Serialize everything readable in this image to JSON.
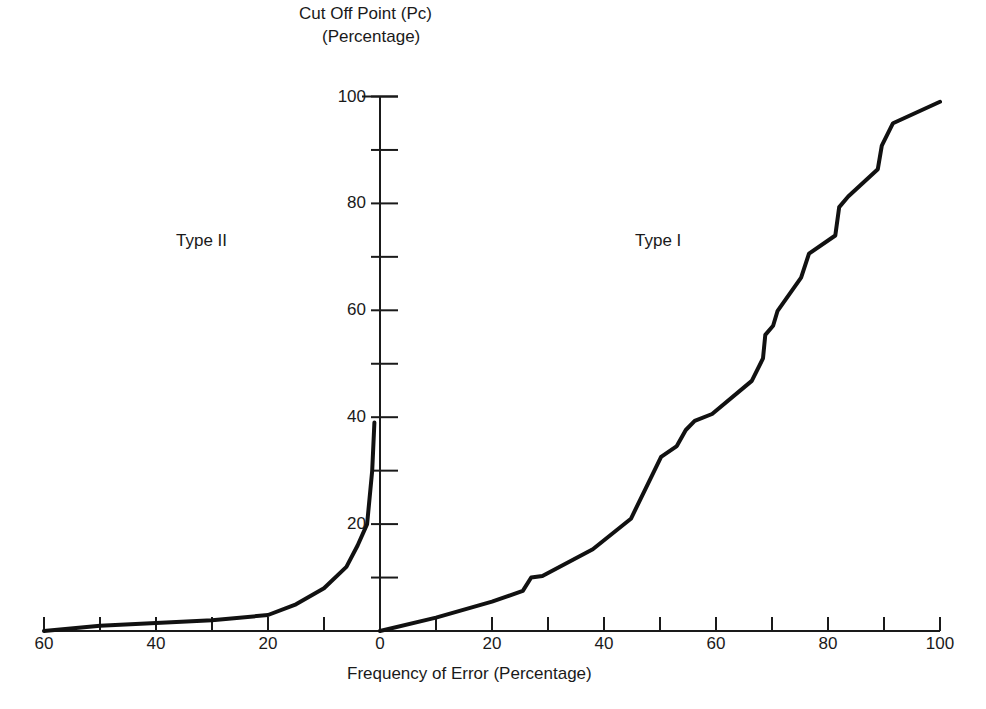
{
  "chart_data": {
    "type": "line",
    "title": "",
    "ylabel": "Cut Off Point (Pc)",
    "ylabel_sub": "(Percentage)",
    "xlabel": "Frequency of Error (Percentage)",
    "x_left_ticks": [
      "60",
      "40",
      "20"
    ],
    "x_right_ticks": [
      "0",
      "20",
      "40",
      "60",
      "80",
      "100"
    ],
    "y_ticks": [
      "100",
      "80",
      "60",
      "40",
      "20"
    ],
    "xlim_left": [
      60,
      0
    ],
    "xlim_right": [
      0,
      100
    ],
    "ylim": [
      0,
      100
    ],
    "grid": false,
    "legend": "none",
    "annotations": [
      "Type II",
      "Type I"
    ],
    "series": [
      {
        "name": "Type II",
        "side": "left",
        "x": [
          60,
          50,
          40,
          30,
          20,
          15,
          10,
          6,
          4,
          2.3,
          1.4,
          1
        ],
        "y": [
          0,
          1,
          1.5,
          2,
          3,
          5,
          8,
          12,
          16,
          20,
          30,
          39
        ]
      },
      {
        "name": "Type I",
        "side": "right",
        "x": [
          0,
          10,
          20,
          25.5,
          27,
          29,
          38,
          44.8,
          50.2,
          53,
          54.6,
          56.2,
          59.3,
          66.4,
          68.4,
          68.8,
          70.2,
          71,
          75.2,
          76.6,
          81.3,
          82,
          83.6,
          88.9,
          89.6,
          91.6,
          100
        ],
        "y": [
          0,
          2.5,
          5.5,
          7.5,
          10,
          10.3,
          15.3,
          21,
          32.6,
          34.6,
          37.6,
          39.3,
          40.6,
          46.8,
          51,
          55.4,
          57.1,
          59.9,
          66.1,
          70.6,
          74,
          79.3,
          81.3,
          86.4,
          90.8,
          95,
          99
        ]
      }
    ]
  },
  "labels": {
    "ytitle1": "Cut Off Point (Pc)",
    "ytitle2": "(Percentage)",
    "xtitle": "Frequency of Error (Percentage)",
    "type2": "Type II",
    "type1": "Type I"
  }
}
